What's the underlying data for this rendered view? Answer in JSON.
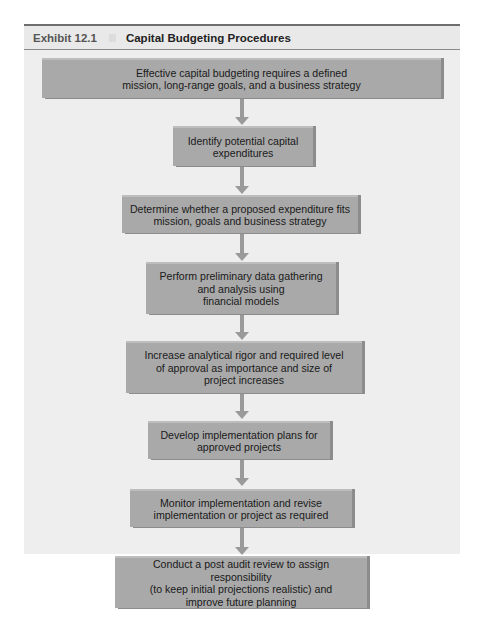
{
  "exhibit": {
    "number": "Exhibit 12.1",
    "title": "Capital Budgeting Procedures"
  },
  "flowchart": {
    "direction": "top-to-bottom",
    "colors": {
      "panel_background": "#eeeeee",
      "box_fill": "#a9a9a9",
      "box_bevel": "#8c8c8c",
      "arrow": "#9a9a9a",
      "text": "#1a1a1a"
    },
    "steps": [
      {
        "label": "Effective capital budgeting requires a defined\nmission, long-range goals, and a business strategy"
      },
      {
        "label": "Identify potential capital\nexpenditures"
      },
      {
        "label": "Determine whether a proposed expenditure fits\nmission, goals and business strategy"
      },
      {
        "label": "Perform preliminary data gathering\nand analysis using\nfinancial models"
      },
      {
        "label": "Increase analytical rigor and required level\nof approval as importance and size of\nproject increases"
      },
      {
        "label": "Develop implementation plans for\napproved projects"
      },
      {
        "label": "Monitor implementation and revise\nimplementation or project as required"
      },
      {
        "label": "Conduct a post audit review to assign responsibility\n(to keep initial projections realistic) and\nimprove future planning"
      }
    ]
  }
}
